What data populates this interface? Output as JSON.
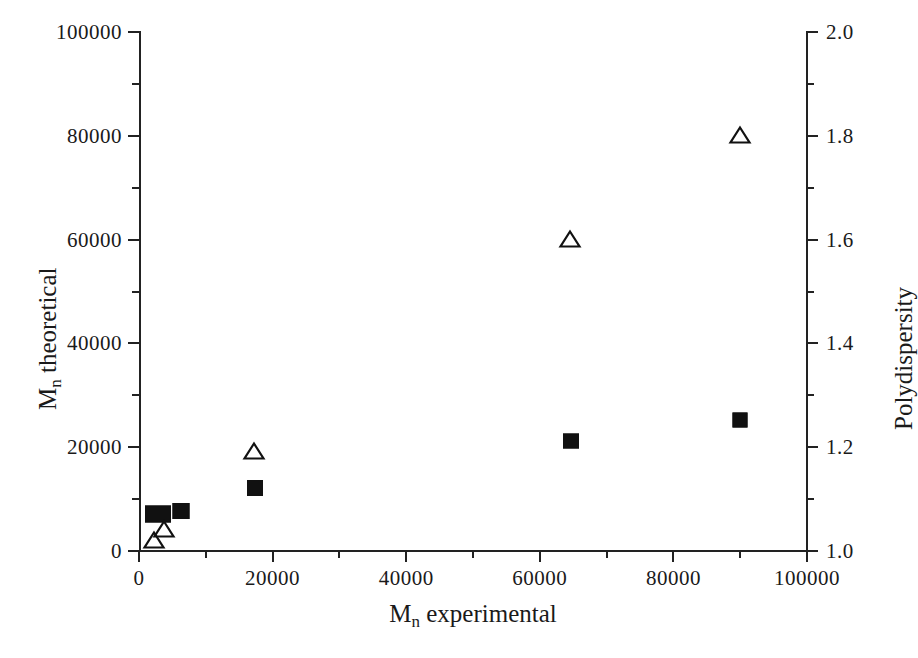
{
  "chart_data": {
    "type": "scatter",
    "title": "",
    "xlabel": "Mn experimental",
    "ylabel": "Mn theoretical",
    "ylabel_right": "Polydispersity",
    "xlim": [
      0,
      100000
    ],
    "ylim": [
      0,
      100000
    ],
    "ylim_right": [
      1.0,
      2.0
    ],
    "grid": false,
    "legend": "none",
    "xticks": [
      0,
      20000,
      40000,
      60000,
      80000,
      100000
    ],
    "xticklabels": [
      "0",
      "20000",
      "40000",
      "60000",
      "80000",
      "100000"
    ],
    "xticks_minor": [
      10000,
      30000,
      50000,
      70000,
      90000
    ],
    "yticks_left": [
      0,
      20000,
      40000,
      60000,
      80000,
      100000
    ],
    "yticklabels_left": [
      "0",
      "20000",
      "40000",
      "60000",
      "80000",
      "100000"
    ],
    "yticks_left_minor": [
      10000,
      30000,
      50000,
      70000,
      90000
    ],
    "yticks_right": [
      1.0,
      1.2,
      1.4,
      1.6,
      1.8,
      2.0
    ],
    "yticklabels_right": [
      "1.0",
      "1.2",
      "1.4",
      "1.6",
      "1.8",
      "2.0"
    ],
    "yticks_right_minor": [
      1.1,
      1.3,
      1.5,
      1.7,
      1.9
    ],
    "series": [
      {
        "name": "Mn theoretical",
        "marker": "filled-square",
        "axis": "left",
        "points": [
          {
            "x": 2900,
            "y": 7000
          },
          {
            "x": 6300,
            "y": 7600
          },
          {
            "x": 17300,
            "y": 12000
          },
          {
            "x": 64600,
            "y": 21000
          },
          {
            "x": 90000,
            "y": 25000
          }
        ]
      },
      {
        "name": "Polydispersity",
        "marker": "open-triangle",
        "axis": "right",
        "points": [
          {
            "x": 2300,
            "y": 1.02
          },
          {
            "x": 3800,
            "y": 1.04
          },
          {
            "x": 17200,
            "y": 1.19
          },
          {
            "x": 64500,
            "y": 1.6
          },
          {
            "x": 90000,
            "y": 1.8
          }
        ]
      }
    ]
  },
  "axes": {
    "x_title_main": "M",
    "x_title_sub": "n",
    "x_title_rest": " experimental",
    "y_left_title_main": "M",
    "y_left_title_sub": "n",
    "y_left_title_rest": " theoretical",
    "y_right_title": "Polydispersity"
  }
}
